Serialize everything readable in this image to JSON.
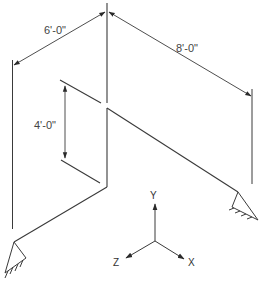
{
  "diagram": {
    "type": "isometric piping frame",
    "colors": {
      "line": "#3a3a3a",
      "text": "#444444",
      "background": "#ffffff"
    },
    "dimensions": [
      {
        "id": "dim-6ft",
        "label": "6'-0\""
      },
      {
        "id": "dim-8ft",
        "label": "8'-0\""
      },
      {
        "id": "dim-4ft",
        "label": "4'-0\""
      }
    ],
    "axes": {
      "y_label": "Y",
      "z_label": "Z",
      "x_label": "X"
    },
    "supports": [
      {
        "id": "support-left",
        "type": "fixed-anchor"
      },
      {
        "id": "support-right",
        "type": "fixed-anchor"
      }
    ]
  }
}
